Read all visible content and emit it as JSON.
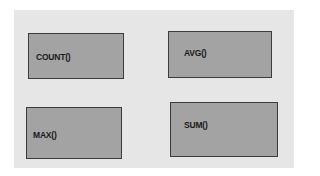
{
  "diagram": {
    "background_color": "#e6e6e6",
    "box_fill_color": "#a3a3a3",
    "box_border_color": "#3c3c3c",
    "boxes": [
      {
        "label": "COUNT()"
      },
      {
        "label": "AVG()"
      },
      {
        "label": "MAX()"
      },
      {
        "label": "SUM()"
      }
    ]
  }
}
